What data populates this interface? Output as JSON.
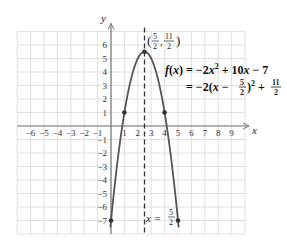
{
  "chart_data": {
    "type": "line",
    "title": "",
    "function": "f(x) = -2x^2 + 10x - 7",
    "xlabel": "x",
    "ylabel": "y",
    "xlim": [
      -7,
      10
    ],
    "ylim": [
      -8,
      7
    ],
    "grid": true,
    "x_ticks": [
      -6,
      -5,
      -4,
      -3,
      -2,
      -1,
      1,
      2,
      3,
      4,
      5,
      6,
      7,
      8,
      9
    ],
    "y_ticks": [
      -7,
      -6,
      -5,
      -4,
      -3,
      -2,
      -1,
      1,
      2,
      3,
      4,
      5,
      6
    ],
    "points": [
      {
        "x": 0,
        "y": -7
      },
      {
        "x": 1,
        "y": 1
      },
      {
        "x": 2.5,
        "y": 5.5
      },
      {
        "x": 4,
        "y": 1
      },
      {
        "x": 5,
        "y": -7
      }
    ],
    "vertex": {
      "x": 2.5,
      "y": 5.5
    },
    "axis_of_symmetry": 2.5,
    "annotations": {
      "vertex_label": "(5/2, 11/2)",
      "equation_line1": "f(x) = −2x² + 10x − 7",
      "equation_line2": "= −2(x − 5/2)² + 11/2",
      "symmetry_label": "x = 5/2"
    },
    "colors": {
      "curve": "#555555",
      "grid": "#d8d8d8",
      "axis": "#777777",
      "dashed": "#333333"
    }
  }
}
